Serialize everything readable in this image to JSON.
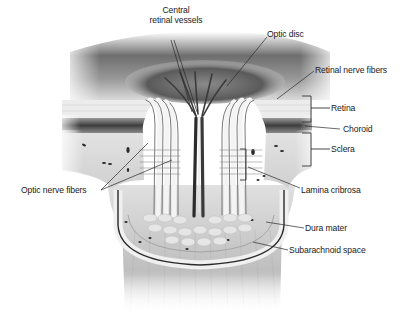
{
  "diagram": {
    "labels": {
      "central_retinal_vessels_line1": "Central",
      "central_retinal_vessels_line2": "retinal vessels",
      "optic_disc": "Optic disc",
      "retinal_nerve_fibers": "Retinal nerve fibers",
      "retina": "Retina",
      "choroid": "Choroid",
      "sclera": "Sclera",
      "optic_nerve_fibers": "Optic nerve fibers",
      "lamina_cribrosa": "Lamina cribrosa",
      "dura_mater": "Dura mater",
      "subarachnoid_space": "Subarachnoid space"
    },
    "colors": {
      "background": "#ffffff",
      "ink": "#1a1a1a",
      "retina": "#e9e9e9",
      "choroid": "#5a5a5a",
      "sclera": "#dcdcdc",
      "vessel": "#2c2c2c",
      "nerve": "#cfcfcf"
    }
  }
}
